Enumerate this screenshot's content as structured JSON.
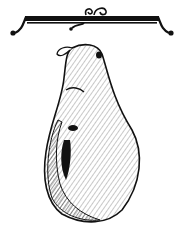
{
  "image": {
    "subject": "hanging ham illustration",
    "style": "black-and-white engraving",
    "colors": {
      "ink": "#111111",
      "paper": "#ffffff",
      "midtone": "#8a8a8a"
    }
  }
}
